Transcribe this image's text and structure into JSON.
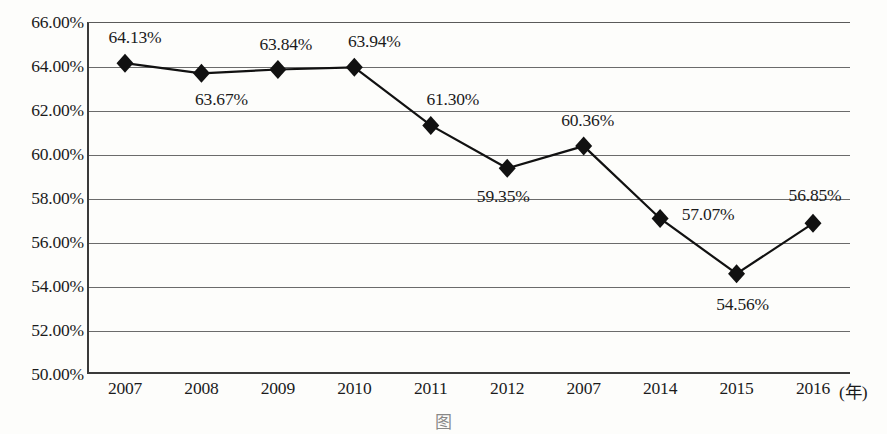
{
  "chart_data": {
    "type": "line",
    "title": "",
    "xlabel": "年",
    "ylabel": "",
    "categories": [
      "2007",
      "2008",
      "2009",
      "2010",
      "2011",
      "2012",
      "2007",
      "2014",
      "2015",
      "2016"
    ],
    "values": [
      64.13,
      63.67,
      63.84,
      63.94,
      61.3,
      59.35,
      60.36,
      57.07,
      54.56,
      56.85
    ],
    "point_labels": [
      "64.13%",
      "63.67%",
      "63.84%",
      "63.94%",
      "61.30%",
      "59.35%",
      "60.36%",
      "57.07%",
      "54.56%",
      "56.85%"
    ],
    "ylim": [
      50.0,
      66.0
    ],
    "ytick_labels": [
      "66.00%",
      "64.00%",
      "62.00%",
      "60.00%",
      "58.00%",
      "56.00%",
      "54.00%",
      "52.00%",
      "50.00%"
    ],
    "ytick_values": [
      66.0,
      64.0,
      62.0,
      60.0,
      58.0,
      56.0,
      54.0,
      52.0,
      50.0
    ],
    "grid": true,
    "legend": "none",
    "marker": "diamond",
    "series_color": "#111111",
    "grid_color": "#6b6b6b",
    "x_unit_label": "(年)"
  },
  "caption": "图"
}
